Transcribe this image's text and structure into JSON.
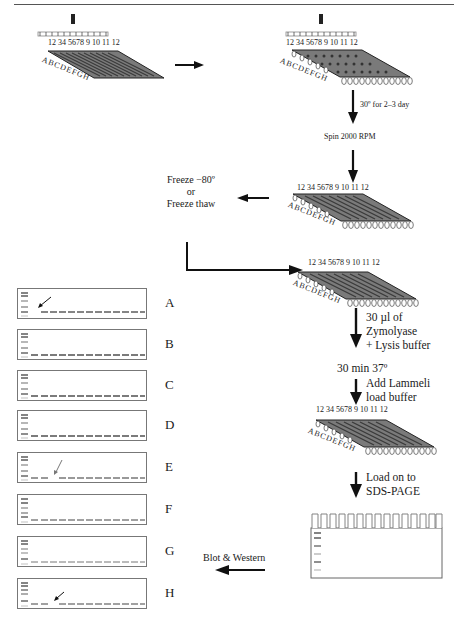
{
  "figure": {
    "plates": [
      {
        "id": "plate-1",
        "column_labels": "12 34 5678 9 10 11 12",
        "row_labels": [
          "A",
          "B",
          "C",
          "D",
          "E",
          "F",
          "G",
          "H"
        ],
        "state": "inoculated with pin replicator"
      },
      {
        "id": "plate-2",
        "column_labels": "12 34 5678 9 10 11 12",
        "row_labels": [
          "A",
          "B",
          "C",
          "D",
          "E",
          "F",
          "G",
          "H"
        ],
        "state": "deep-well grown"
      },
      {
        "id": "plate-3",
        "column_labels": "12 34 5678 9 10 11 12",
        "row_labels": [
          "A",
          "B",
          "C",
          "D",
          "E",
          "F",
          "G",
          "H"
        ]
      },
      {
        "id": "plate-4",
        "column_labels": "12 34 5678 9 10 11 12",
        "row_labels": [
          "A",
          "B",
          "C",
          "D",
          "E",
          "F",
          "G",
          "H"
        ]
      },
      {
        "id": "plate-5",
        "column_labels": "12 34 5678 9 10 11 12",
        "row_labels": [
          "A",
          "B",
          "C",
          "D",
          "E",
          "F",
          "G",
          "H"
        ]
      }
    ],
    "steps": {
      "incubate": "30º for 2–3 day",
      "spin": "Spin 2000 RPM",
      "freeze_line1": "Freeze −80º",
      "freeze_line2": "or",
      "freeze_line3": "Freeze thaw",
      "zymolyase_line1": "30 µl of",
      "zymolyase_line2": "Zymolyase",
      "zymolyase_line3": "+ Lysis buffer",
      "incubate2": "30 min 37º",
      "lammeli_line1": "Add Lammeli",
      "lammeli_line2": "load buffer",
      "load_line1": "Load on to",
      "load_line2": "SDS-PAGE",
      "blot": "Blot & Western"
    },
    "blots": [
      {
        "row": "A",
        "missing_lane": 1,
        "arrow": true
      },
      {
        "row": "B",
        "missing_lane": null,
        "arrow": false
      },
      {
        "row": "C",
        "missing_lane": null,
        "arrow": false
      },
      {
        "row": "D",
        "missing_lane": null,
        "arrow": false
      },
      {
        "row": "E",
        "missing_lane": 3,
        "arrow": true
      },
      {
        "row": "F",
        "missing_lane": null,
        "arrow": false
      },
      {
        "row": "G",
        "missing_lane": null,
        "arrow": false
      },
      {
        "row": "H",
        "missing_lane": 3,
        "arrow": true
      }
    ],
    "gel": {
      "wells": 15,
      "marker_bands": 6
    },
    "colors": {
      "ink": "#1a1a1a",
      "plate_fill": "#7a7a7a",
      "well_dark": "#3a3a3a",
      "rule": "#555555",
      "faint": "#bbbbbb"
    }
  }
}
